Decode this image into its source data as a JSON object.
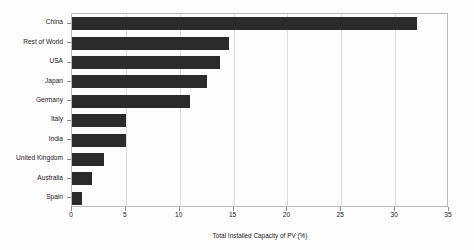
{
  "chart_data": {
    "type": "bar",
    "orientation": "horizontal",
    "title": "",
    "xlabel": "Total Installed Capacity of PV  (%)",
    "ylabel": "",
    "categories": [
      "China",
      "Rest of World",
      "USA",
      "Japan",
      "Germany",
      "Italy",
      "India",
      "United Kingdom",
      "Australia",
      "Spain"
    ],
    "values": [
      32.0,
      14.6,
      13.7,
      12.5,
      11.0,
      5.0,
      5.0,
      3.0,
      1.9,
      0.9
    ],
    "xlim": [
      0,
      35
    ],
    "xticks": [
      0,
      5,
      10,
      15,
      20,
      25,
      30,
      35
    ],
    "xtick_labels": [
      "0",
      "5",
      "10",
      "15",
      "20",
      "25",
      "30",
      "35"
    ],
    "grid": true,
    "grid_axis": "x",
    "legend": false,
    "bar_color": "#2b2b2b",
    "background_color": "#ffffff",
    "frame_color": "#b9b9b9",
    "gridline_color": "#dedede"
  }
}
